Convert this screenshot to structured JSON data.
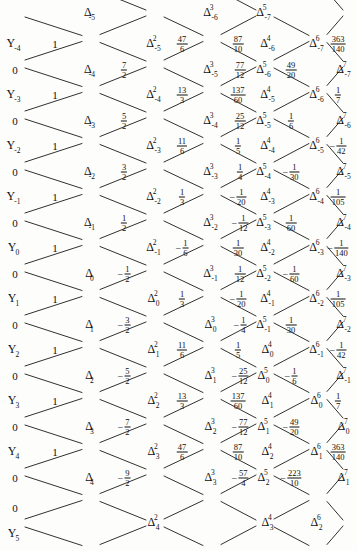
{
  "figure": {
    "kind": "difference-table-lattice",
    "width": 357,
    "height": 551,
    "ink_color": "#111111",
    "background": "#fdfdfb"
  },
  "chart_data": {
    "type": "table",
    "title": "",
    "xlabel": "",
    "ylabel": "",
    "columns": [
      "Y",
      "0",
      "Delta",
      "Delta^2",
      "Delta^3",
      "Delta^4",
      "Delta^5",
      "Delta^6",
      "Delta^7"
    ],
    "grid": false,
    "legend": null
  },
  "y_labels": [
    {
      "text": "Y",
      "sub": "-4",
      "x": 14,
      "y": 44
    },
    {
      "text": "Y",
      "sub": "-3",
      "x": 14,
      "y": 95
    },
    {
      "text": "Y",
      "sub": "-2",
      "x": 14,
      "y": 146
    },
    {
      "text": "Y",
      "sub": "-1",
      "x": 14,
      "y": 197
    },
    {
      "text": "Y",
      "sub": "0",
      "x": 14,
      "y": 248
    },
    {
      "text": "Y",
      "sub": "1",
      "x": 14,
      "y": 299
    },
    {
      "text": "Y",
      "sub": "2",
      "x": 14,
      "y": 350
    },
    {
      "text": "Y",
      "sub": "3",
      "x": 14,
      "y": 401
    },
    {
      "text": "Y",
      "sub": "4",
      "x": 14,
      "y": 452
    },
    {
      "text": "Y",
      "sub": "5",
      "x": 14,
      "y": 534
    }
  ],
  "zeros": [
    {
      "text": "0",
      "x": 15,
      "y": 70
    },
    {
      "text": "0",
      "x": 15,
      "y": 121
    },
    {
      "text": "0",
      "x": 15,
      "y": 172
    },
    {
      "text": "0",
      "x": 15,
      "y": 223
    },
    {
      "text": "0",
      "x": 15,
      "y": 274
    },
    {
      "text": "0",
      "x": 15,
      "y": 325
    },
    {
      "text": "0",
      "x": 15,
      "y": 376
    },
    {
      "text": "0",
      "x": 15,
      "y": 427
    },
    {
      "text": "0",
      "x": 15,
      "y": 478
    },
    {
      "text": "0",
      "x": 15,
      "y": 508
    }
  ],
  "nodes": [
    {
      "sup": "",
      "sub": "-5",
      "x": 91,
      "y": 13
    },
    {
      "sup": "",
      "sub": "-4",
      "x": 91,
      "y": 70
    },
    {
      "sup": "",
      "sub": "-3",
      "x": 91,
      "y": 121
    },
    {
      "sup": "",
      "sub": "-2",
      "x": 91,
      "y": 172
    },
    {
      "sup": "",
      "sub": "-1",
      "x": 91,
      "y": 223
    },
    {
      "sup": "",
      "sub": "0",
      "x": 91,
      "y": 274
    },
    {
      "sup": "",
      "sub": "1",
      "x": 91,
      "y": 325
    },
    {
      "sup": "",
      "sub": "2",
      "x": 91,
      "y": 376
    },
    {
      "sup": "",
      "sub": "3",
      "x": 91,
      "y": 427
    },
    {
      "sup": "",
      "sub": "4",
      "x": 91,
      "y": 478
    },
    {
      "sup": "2",
      "sub": "-5",
      "x": 155,
      "y": 44
    },
    {
      "sup": "2",
      "sub": "-4",
      "x": 155,
      "y": 95
    },
    {
      "sup": "2",
      "sub": "-3",
      "x": 155,
      "y": 146
    },
    {
      "sup": "2",
      "sub": "-2",
      "x": 155,
      "y": 197
    },
    {
      "sup": "2",
      "sub": "-1",
      "x": 155,
      "y": 248
    },
    {
      "sup": "2",
      "sub": "0",
      "x": 155,
      "y": 299
    },
    {
      "sup": "2",
      "sub": "1",
      "x": 155,
      "y": 350
    },
    {
      "sup": "2",
      "sub": "2",
      "x": 155,
      "y": 401
    },
    {
      "sup": "2",
      "sub": "3",
      "x": 155,
      "y": 452
    },
    {
      "sup": "2",
      "sub": "4",
      "x": 155,
      "y": 523
    },
    {
      "sup": "3",
      "sub": "-6",
      "x": 212,
      "y": 13
    },
    {
      "sup": "3",
      "sub": "-5",
      "x": 212,
      "y": 70
    },
    {
      "sup": "3",
      "sub": "-4",
      "x": 212,
      "y": 121
    },
    {
      "sup": "3",
      "sub": "-3",
      "x": 212,
      "y": 172
    },
    {
      "sup": "3",
      "sub": "-2",
      "x": 212,
      "y": 223
    },
    {
      "sup": "3",
      "sub": "-1",
      "x": 212,
      "y": 274
    },
    {
      "sup": "3",
      "sub": "0",
      "x": 212,
      "y": 325
    },
    {
      "sup": "3",
      "sub": "1",
      "x": 212,
      "y": 376
    },
    {
      "sup": "3",
      "sub": "2",
      "x": 212,
      "y": 427
    },
    {
      "sup": "3",
      "sub": "3",
      "x": 212,
      "y": 478
    },
    {
      "sup": "4",
      "sub": "-6",
      "x": 269,
      "y": 44
    },
    {
      "sup": "4",
      "sub": "-5",
      "x": 269,
      "y": 95
    },
    {
      "sup": "4",
      "sub": "-4",
      "x": 269,
      "y": 146
    },
    {
      "sup": "4",
      "sub": "-3",
      "x": 269,
      "y": 197
    },
    {
      "sup": "4",
      "sub": "-2",
      "x": 269,
      "y": 248
    },
    {
      "sup": "4",
      "sub": "-1",
      "x": 269,
      "y": 299
    },
    {
      "sup": "4",
      "sub": "0",
      "x": 269,
      "y": 350
    },
    {
      "sup": "4",
      "sub": "1",
      "x": 269,
      "y": 401
    },
    {
      "sup": "4",
      "sub": "2",
      "x": 269,
      "y": 452
    },
    {
      "sup": "4",
      "sub": "3",
      "x": 269,
      "y": 523
    },
    {
      "sup": "5",
      "sub": "-7",
      "x": 265,
      "y": 13
    },
    {
      "sup": "5",
      "sub": "-6",
      "x": 265,
      "y": 70
    },
    {
      "sup": "5",
      "sub": "-5",
      "x": 265,
      "y": 121
    },
    {
      "sup": "5",
      "sub": "-4",
      "x": 265,
      "y": 172
    },
    {
      "sup": "5",
      "sub": "-3",
      "x": 265,
      "y": 223
    },
    {
      "sup": "5",
      "sub": "-2",
      "x": 265,
      "y": 274
    },
    {
      "sup": "5",
      "sub": "-1",
      "x": 265,
      "y": 325
    },
    {
      "sup": "5",
      "sub": "0",
      "x": 265,
      "y": 376
    },
    {
      "sup": "5",
      "sub": "1",
      "x": 265,
      "y": 427
    },
    {
      "sup": "5",
      "sub": "2",
      "x": 265,
      "y": 478
    },
    {
      "sup": "6",
      "sub": "-7",
      "x": 318,
      "y": 44
    },
    {
      "sup": "6",
      "sub": "-6",
      "x": 318,
      "y": 95
    },
    {
      "sup": "6",
      "sub": "-5",
      "x": 318,
      "y": 146
    },
    {
      "sup": "6",
      "sub": "-4",
      "x": 318,
      "y": 197
    },
    {
      "sup": "6",
      "sub": "-3",
      "x": 318,
      "y": 248
    },
    {
      "sup": "6",
      "sub": "-2",
      "x": 318,
      "y": 299
    },
    {
      "sup": "6",
      "sub": "-1",
      "x": 318,
      "y": 350
    },
    {
      "sup": "6",
      "sub": "0",
      "x": 318,
      "y": 401
    },
    {
      "sup": "6",
      "sub": "1",
      "x": 318,
      "y": 452
    },
    {
      "sup": "6",
      "sub": "2",
      "x": 318,
      "y": 523
    },
    {
      "sup": "7",
      "sub": "-7",
      "x": 345,
      "y": 70
    },
    {
      "sup": "7",
      "sub": "-6",
      "x": 345,
      "y": 121
    },
    {
      "sup": "7",
      "sub": "-5",
      "x": 345,
      "y": 172
    },
    {
      "sup": "7",
      "sub": "-4",
      "x": 345,
      "y": 223
    },
    {
      "sup": "7",
      "sub": "-3",
      "x": 345,
      "y": 274
    },
    {
      "sup": "7",
      "sub": "-2",
      "x": 345,
      "y": 325
    },
    {
      "sup": "7",
      "sub": "-1",
      "x": 345,
      "y": 376
    },
    {
      "sup": "7",
      "sub": "0",
      "x": 345,
      "y": 427
    },
    {
      "sup": "7",
      "sub": "1",
      "x": 345,
      "y": 478
    }
  ],
  "values": [
    {
      "x": 55,
      "y": 44,
      "sign": "",
      "int": "1"
    },
    {
      "x": 55,
      "y": 95,
      "sign": "",
      "int": "1"
    },
    {
      "x": 55,
      "y": 146,
      "sign": "",
      "int": "1"
    },
    {
      "x": 55,
      "y": 197,
      "sign": "",
      "int": "1"
    },
    {
      "x": 55,
      "y": 248,
      "sign": "",
      "int": "1"
    },
    {
      "x": 55,
      "y": 299,
      "sign": "",
      "int": "1"
    },
    {
      "x": 55,
      "y": 350,
      "sign": "",
      "int": "1"
    },
    {
      "x": 55,
      "y": 401,
      "sign": "",
      "int": "1"
    },
    {
      "x": 55,
      "y": 452,
      "sign": "",
      "int": "1"
    },
    {
      "x": 124,
      "y": 70,
      "sign": "",
      "num": "7",
      "den": "2"
    },
    {
      "x": 124,
      "y": 121,
      "sign": "",
      "num": "5",
      "den": "2"
    },
    {
      "x": 124,
      "y": 172,
      "sign": "",
      "num": "3",
      "den": "2"
    },
    {
      "x": 124,
      "y": 223,
      "sign": "",
      "num": "1",
      "den": "2"
    },
    {
      "x": 124,
      "y": 274,
      "sign": "−",
      "num": "1",
      "den": "2"
    },
    {
      "x": 124,
      "y": 325,
      "sign": "−",
      "num": "3",
      "den": "2"
    },
    {
      "x": 124,
      "y": 376,
      "sign": "−",
      "num": "5",
      "den": "2"
    },
    {
      "x": 124,
      "y": 427,
      "sign": "−",
      "num": "7",
      "den": "2"
    },
    {
      "x": 124,
      "y": 478,
      "sign": "−",
      "num": "9",
      "den": "2"
    },
    {
      "x": 182,
      "y": 44,
      "sign": "",
      "num": "47",
      "den": "6"
    },
    {
      "x": 182,
      "y": 95,
      "sign": "",
      "num": "13",
      "den": "3"
    },
    {
      "x": 182,
      "y": 146,
      "sign": "",
      "num": "11",
      "den": "6"
    },
    {
      "x": 182,
      "y": 197,
      "sign": "",
      "num": "1",
      "den": "3"
    },
    {
      "x": 182,
      "y": 248,
      "sign": "−",
      "num": "1",
      "den": "6"
    },
    {
      "x": 182,
      "y": 299,
      "sign": "",
      "num": "1",
      "den": "3"
    },
    {
      "x": 182,
      "y": 350,
      "sign": "",
      "num": "11",
      "den": "6"
    },
    {
      "x": 182,
      "y": 401,
      "sign": "",
      "num": "13",
      "den": "3"
    },
    {
      "x": 182,
      "y": 452,
      "sign": "",
      "num": "47",
      "den": "6"
    },
    {
      "x": 240,
      "y": 70,
      "sign": "",
      "num": "77",
      "den": "12"
    },
    {
      "x": 240,
      "y": 121,
      "sign": "",
      "num": "25",
      "den": "12"
    },
    {
      "x": 240,
      "y": 172,
      "sign": "",
      "num": "1",
      "den": "4"
    },
    {
      "x": 240,
      "y": 223,
      "sign": "−",
      "num": "1",
      "den": "12"
    },
    {
      "x": 240,
      "y": 274,
      "sign": "",
      "num": "1",
      "den": "12"
    },
    {
      "x": 240,
      "y": 325,
      "sign": "−",
      "num": "1",
      "den": "4"
    },
    {
      "x": 240,
      "y": 376,
      "sign": "−",
      "num": "25",
      "den": "12"
    },
    {
      "x": 240,
      "y": 427,
      "sign": "−",
      "num": "77",
      "den": "12"
    },
    {
      "x": 240,
      "y": 478,
      "sign": "−",
      "num": "57",
      "den": "4"
    },
    {
      "x": 238,
      "y": 44,
      "sign": "",
      "num": "87",
      "den": "10"
    },
    {
      "x": 238,
      "y": 95,
      "sign": "",
      "num": "137",
      "den": "60"
    },
    {
      "x": 238,
      "y": 146,
      "sign": "",
      "num": "1",
      "den": "5"
    },
    {
      "x": 238,
      "y": 197,
      "sign": "−",
      "num": "1",
      "den": "20"
    },
    {
      "x": 238,
      "y": 248,
      "sign": "",
      "num": "1",
      "den": "30"
    },
    {
      "x": 238,
      "y": 299,
      "sign": "−",
      "num": "1",
      "den": "20"
    },
    {
      "x": 238,
      "y": 350,
      "sign": "",
      "num": "1",
      "den": "5"
    },
    {
      "x": 238,
      "y": 401,
      "sign": "",
      "num": "137",
      "den": "60"
    },
    {
      "x": 238,
      "y": 452,
      "sign": "",
      "num": "87",
      "den": "10"
    },
    {
      "x": 291,
      "y": 70,
      "sign": "",
      "num": "49",
      "den": "20"
    },
    {
      "x": 291,
      "y": 121,
      "sign": "",
      "num": "1",
      "den": "6"
    },
    {
      "x": 291,
      "y": 172,
      "sign": "−",
      "num": "1",
      "den": "30"
    },
    {
      "x": 291,
      "y": 223,
      "sign": "",
      "num": "1",
      "den": "60"
    },
    {
      "x": 291,
      "y": 274,
      "sign": "−",
      "num": "1",
      "den": "60"
    },
    {
      "x": 291,
      "y": 325,
      "sign": "",
      "num": "1",
      "den": "30"
    },
    {
      "x": 291,
      "y": 376,
      "sign": "−",
      "num": "1",
      "den": "6"
    },
    {
      "x": 291,
      "y": 427,
      "sign": "−",
      "num": "49",
      "den": "20"
    },
    {
      "x": 291,
      "y": 478,
      "sign": "−",
      "num": "223",
      "den": "10"
    },
    {
      "x": 338,
      "y": 44,
      "sign": "",
      "num": "363",
      "den": "140"
    },
    {
      "x": 338,
      "y": 95,
      "sign": "",
      "num": "1",
      "den": "7"
    },
    {
      "x": 338,
      "y": 146,
      "sign": "−",
      "num": "1",
      "den": "42"
    },
    {
      "x": 338,
      "y": 197,
      "sign": "",
      "num": "1",
      "den": "105"
    },
    {
      "x": 338,
      "y": 248,
      "sign": "−",
      "num": "1",
      "den": "140"
    },
    {
      "x": 338,
      "y": 299,
      "sign": "",
      "num": "1",
      "den": "105"
    },
    {
      "x": 338,
      "y": 350,
      "sign": "−",
      "num": "1",
      "den": "42"
    },
    {
      "x": 338,
      "y": 401,
      "sign": "",
      "num": "1",
      "den": "7"
    },
    {
      "x": 338,
      "y": 452,
      "sign": "",
      "num": "363",
      "den": "140"
    }
  ]
}
